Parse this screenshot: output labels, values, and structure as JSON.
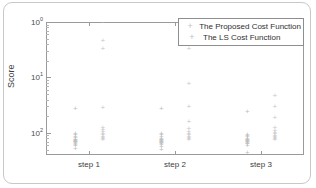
{
  "figure": {
    "ylabel": "Score",
    "legend": {
      "items": [
        {
          "label": "The Proposed Cost Function",
          "marker": "+"
        },
        {
          "label": "The LS Cost Function",
          "marker": "+"
        }
      ]
    },
    "ytick_labels": [
      "10",
      "10",
      "10"
    ],
    "ytick_exponents": [
      "2",
      "1",
      "0"
    ],
    "xtick_labels": [
      "step 1",
      "step 2",
      "step 3"
    ]
  },
  "chart_data": {
    "type": "scatter",
    "title": "",
    "xlabel": "",
    "ylabel": "Score",
    "yscale": "log",
    "ylim": [
      0.4,
      100
    ],
    "xlim": [
      0,
      3
    ],
    "grid": false,
    "legend_position": "top-right",
    "categories": [
      "step 1",
      "step 2",
      "step 3"
    ],
    "yticks": [
      1,
      10,
      100
    ],
    "ytick_text": [
      "10^0",
      "10^1",
      "10^2"
    ],
    "series": [
      {
        "name": "The Proposed Cost Function",
        "marker": "+",
        "color": "#bdbdbd",
        "groups": [
          {
            "category": "step 1",
            "x_offset": -0.16,
            "values": [
              2.65,
              0.97,
              0.92,
              0.86,
              0.8,
              0.76,
              0.74,
              0.72,
              0.71,
              0.7,
              0.69,
              0.68,
              0.66,
              0.64,
              0.61,
              0.57,
              0.52
            ]
          },
          {
            "category": "step 2",
            "x_offset": -0.16,
            "values": [
              2.7,
              0.95,
              0.9,
              0.84,
              0.79,
              0.76,
              0.74,
              0.72,
              0.71,
              0.7,
              0.69,
              0.67,
              0.65,
              0.63,
              0.6,
              0.55,
              0.5
            ]
          },
          {
            "category": "step 3",
            "x_offset": -0.16,
            "values": [
              2.35,
              0.93,
              0.88,
              0.83,
              0.79,
              0.76,
              0.74,
              0.72,
              0.71,
              0.7,
              0.68,
              0.66,
              0.64,
              0.62,
              0.59,
              0.43
            ]
          }
        ]
      },
      {
        "name": "The LS Cost Function",
        "marker": "+",
        "color": "#c9c9c9",
        "groups": [
          {
            "category": "step 1",
            "x_offset": 0.16,
            "values": [
              100.0,
              46.0,
              33.0,
              2.85,
              1.25,
              1.12,
              1.02,
              0.95,
              0.9,
              0.86,
              0.82,
              0.79,
              0.76
            ]
          },
          {
            "category": "step 2",
            "x_offset": 0.16,
            "values": [
              33.0,
              7.6,
              2.9,
              1.55,
              1.2,
              1.05,
              0.96,
              0.9,
              0.86,
              0.82,
              0.79,
              0.76
            ]
          },
          {
            "category": "step 3",
            "x_offset": 0.16,
            "values": [
              4.6,
              2.9,
              1.85,
              1.25,
              1.1,
              1.0,
              0.94,
              0.89,
              0.85,
              0.81,
              0.78,
              0.75
            ]
          }
        ]
      }
    ]
  }
}
